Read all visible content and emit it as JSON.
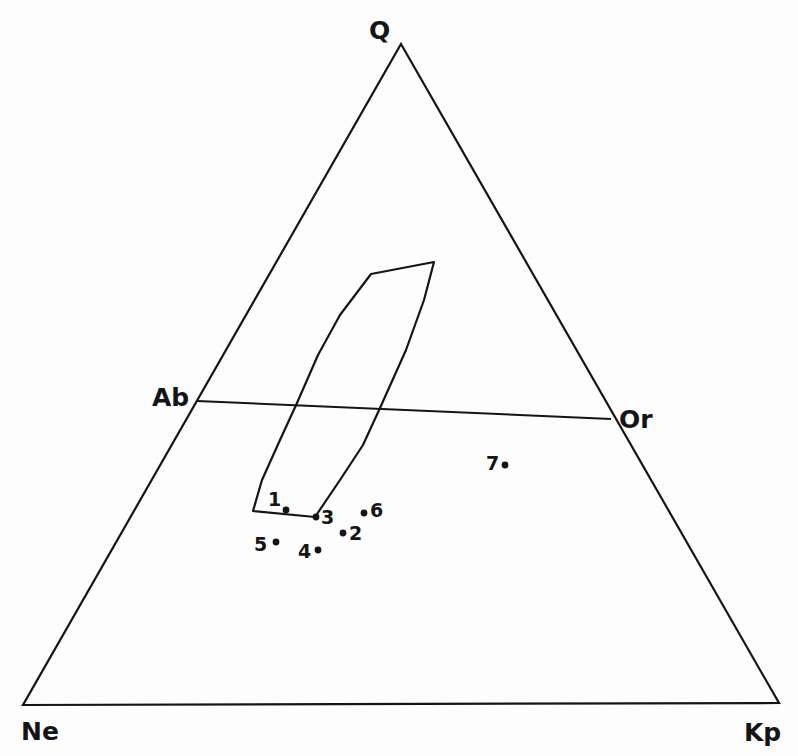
{
  "diagram": {
    "type": "ternary",
    "vertices": {
      "top": {
        "label": "Q",
        "x": 401,
        "y": 44
      },
      "bottom_left": {
        "label": "Ne",
        "x": 23,
        "y": 705
      },
      "bottom_right": {
        "label": "Kp",
        "x": 779,
        "y": 703
      }
    },
    "tie_line": {
      "start_label": "Ab",
      "end_label": "Or",
      "x1": 197,
      "y1": 401,
      "x2": 611,
      "y2": 419
    },
    "field_outline": [
      [
        371,
        274
      ],
      [
        434,
        262
      ],
      [
        424,
        300
      ],
      [
        406,
        350
      ],
      [
        380,
        408
      ],
      [
        363,
        445
      ],
      [
        340,
        480
      ],
      [
        315,
        517
      ],
      [
        253,
        511
      ],
      [
        262,
        480
      ],
      [
        280,
        440
      ],
      [
        297,
        403
      ],
      [
        318,
        355
      ],
      [
        340,
        315
      ]
    ],
    "points": [
      {
        "id": "1",
        "label": "1",
        "x": 286,
        "y": 510,
        "lx": 268,
        "ly": 506
      },
      {
        "id": "2",
        "label": "2",
        "x": 343,
        "y": 533,
        "lx": 349,
        "ly": 540
      },
      {
        "id": "3",
        "label": "3",
        "x": 316,
        "y": 517,
        "lx": 321,
        "ly": 524
      },
      {
        "id": "4",
        "label": "4",
        "x": 318,
        "y": 550,
        "lx": 298,
        "ly": 558
      },
      {
        "id": "5",
        "label": "5",
        "x": 276,
        "y": 542,
        "lx": 254,
        "ly": 551
      },
      {
        "id": "6",
        "label": "6",
        "x": 364,
        "y": 513,
        "lx": 370,
        "ly": 517
      },
      {
        "id": "7",
        "label": "7",
        "x": 505,
        "y": 465,
        "lx": 486,
        "ly": 470
      }
    ],
    "labels": {
      "Q": {
        "text": "Q",
        "x": 369,
        "y": 39
      },
      "Ab": {
        "text": "Ab",
        "x": 152,
        "y": 406
      },
      "Or": {
        "text": "Or",
        "x": 619,
        "y": 428
      },
      "Ne": {
        "text": "Ne",
        "x": 21,
        "y": 740
      },
      "Kp": {
        "text": "Kp",
        "x": 744,
        "y": 741
      }
    }
  }
}
